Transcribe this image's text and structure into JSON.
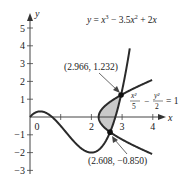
{
  "chart_data": {
    "type": "line",
    "title": "",
    "xlabel": "x",
    "ylabel": "y",
    "xlim": [
      0,
      4
    ],
    "ylim": [
      -3,
      5
    ],
    "x_ticks": [
      "0",
      "1",
      "2",
      "3",
      "4"
    ],
    "y_ticks": [
      "5",
      "4",
      "3",
      "2",
      "1",
      "-1",
      "-2",
      "-3"
    ],
    "grid": false,
    "series": [
      {
        "name": "y = x^3 - 3.5x^2 + 2x",
        "label": "y = x³ − 3.5x² + 2x",
        "type": "cubic",
        "x": [
          0,
          0.5,
          1,
          1.5,
          2,
          2.5,
          2.608,
          2.966,
          3.2
        ],
        "values": [
          0,
          0.25,
          -0.5,
          -1.5,
          -2,
          -1.25,
          -0.85,
          1.232,
          5
        ]
      },
      {
        "name": "x^2/5 - y^2/2 = 1",
        "label_num1": "x²",
        "label_den1": "5",
        "label_num2": "y²",
        "label_den2": "2",
        "label_rhs": "= 1",
        "type": "hyperbola",
        "x": [
          2.236,
          2.608,
          2.966,
          4
        ],
        "values_upper": [
          0,
          0.85,
          1.232,
          2.098
        ],
        "values_lower": [
          0,
          -0.85,
          -1.232,
          -2.098
        ]
      }
    ],
    "shaded_region": "area between the cubic and the hyperbola from y=-0.850 to y=1.232",
    "annotations": [
      {
        "text": "(2.966, 1.232)",
        "x": 2.966,
        "y": 1.232
      },
      {
        "text": "(2.608, −0.850)",
        "x": 2.608,
        "y": -0.85
      }
    ]
  }
}
